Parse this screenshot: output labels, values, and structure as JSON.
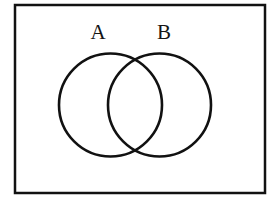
{
  "figure": {
    "type": "venn-diagram",
    "title": "",
    "background_color": "#ffffff",
    "stroke_color": "#111111",
    "canvas": {
      "width": 277,
      "height": 208
    }
  },
  "universe_rectangle": {
    "label": "",
    "x": 15,
    "y": 5,
    "width": 250,
    "height": 188,
    "stroke_width": 2.5,
    "fill": "none"
  },
  "sets": [
    {
      "label": "A",
      "shape": "circle",
      "cx": 110.5,
      "cy": 105,
      "r": 51.5,
      "stroke_width": 2.6,
      "fill": "none",
      "label_x": 98,
      "label_y": 34
    },
    {
      "label": "B",
      "shape": "circle",
      "cx": 159.5,
      "cy": 105,
      "r": 51.5,
      "stroke_width": 2.6,
      "fill": "none",
      "label_x": 164,
      "label_y": 34
    }
  ],
  "regions": {
    "intersection_label": "",
    "left_only_label": "",
    "right_only_label": "",
    "outside_label": ""
  }
}
